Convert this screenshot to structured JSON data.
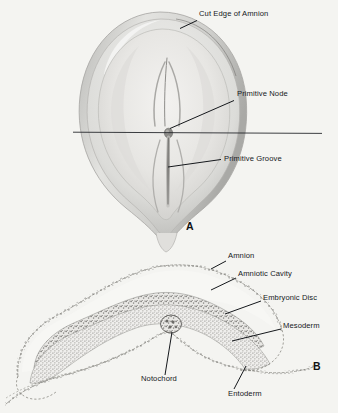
{
  "figure": {
    "background_color": "#f4f4f1",
    "ink_color": "#15181c",
    "tissue_gray": "#9a9a98",
    "amnion_gray": "#c9c9c7"
  },
  "panels": [
    {
      "id": "A",
      "mark": "A",
      "mark_x": 186,
      "mark_y": 221,
      "caption": "Dorsal view of embryonic disc with amnion cut away",
      "section_line": {
        "x1": 73,
        "y1": 132,
        "x2": 322,
        "y2": 133
      }
    },
    {
      "id": "B",
      "mark": "B",
      "mark_x": 313,
      "mark_y": 361,
      "caption": "Transverse section through the primitive node"
    }
  ],
  "labels": [
    {
      "id": "cut-edge-of-amnion",
      "text": "Cut Edge of Amnion",
      "panel": "A",
      "x": 199,
      "y": 14,
      "leader": {
        "x1": 197,
        "y1": 21,
        "x2": 180,
        "y2": 28
      }
    },
    {
      "id": "primitive-node",
      "text": "Primitive Node",
      "panel": "A",
      "x": 237,
      "y": 94,
      "leader": {
        "x1": 234,
        "y1": 101,
        "x2": 169,
        "y2": 128
      }
    },
    {
      "id": "primitive-groove",
      "text": "Primitive Groove",
      "panel": "A",
      "x": 224,
      "y": 159,
      "leader": {
        "x1": 221,
        "y1": 160,
        "x2": 168,
        "y2": 166
      }
    },
    {
      "id": "amnion",
      "text": "Amnion",
      "panel": "B",
      "x": 228,
      "y": 256,
      "leader": {
        "x1": 226,
        "y1": 261,
        "x2": 212,
        "y2": 268
      }
    },
    {
      "id": "amniotic-cavity",
      "text": "Amniotic Cavity",
      "panel": "B",
      "x": 238,
      "y": 274,
      "leader": {
        "x1": 236,
        "y1": 278,
        "x2": 212,
        "y2": 289
      }
    },
    {
      "id": "embryonic-disc",
      "text": "Embryonic Disc",
      "panel": "B",
      "x": 263,
      "y": 298,
      "leader": {
        "x1": 261,
        "y1": 301,
        "x2": 225,
        "y2": 314
      }
    },
    {
      "id": "mesoderm",
      "text": "Mesoderm",
      "panel": "B",
      "x": 283,
      "y": 326,
      "leader": {
        "x1": 281,
        "y1": 329,
        "x2": 232,
        "y2": 340
      }
    },
    {
      "id": "notochord",
      "text": "Notochord",
      "panel": "B",
      "x": 141,
      "y": 379,
      "leader": {
        "x1": 165,
        "y1": 376,
        "x2": 171,
        "y2": 331
      }
    },
    {
      "id": "entoderm",
      "text": "Entoderm",
      "panel": "B",
      "x": 228,
      "y": 394,
      "leader": {
        "x1": 234,
        "y1": 390,
        "x2": 245,
        "y2": 367
      }
    }
  ]
}
